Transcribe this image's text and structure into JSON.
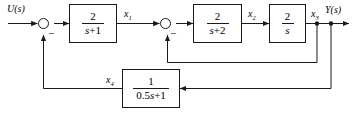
{
  "diagram": {
    "type": "control-system-block-diagram",
    "input_label": "U(s)",
    "output_label": "Y(s)",
    "signals": {
      "x1": "x",
      "x1_sub": "1",
      "x2": "x",
      "x2_sub": "2",
      "x3": "x",
      "x3_sub": "3",
      "x4": "x",
      "x4_sub": "4"
    },
    "summing_junctions": [
      {
        "name": "sum-1",
        "sign_input": "+",
        "sign_feedback": "−"
      },
      {
        "name": "sum-2",
        "sign_input": "+",
        "sign_feedback": "−"
      }
    ],
    "blocks": [
      {
        "name": "block-g1",
        "numerator": "2",
        "denominator": "s+1",
        "den_var": "s",
        "den_rest": "+1"
      },
      {
        "name": "block-g2",
        "numerator": "2",
        "denominator": "s+2",
        "den_var": "s",
        "den_rest": "+2"
      },
      {
        "name": "block-g3",
        "numerator": "2",
        "denominator": "s",
        "den_var": "s",
        "den_rest": ""
      },
      {
        "name": "block-h1",
        "numerator": "1",
        "denominator": "0.5s+1",
        "den_lead": "0.5",
        "den_var": "s",
        "den_rest": "+1"
      }
    ],
    "colors": {
      "line": "#1a1a1a",
      "background": "#ffffff",
      "text": "#000000"
    }
  }
}
